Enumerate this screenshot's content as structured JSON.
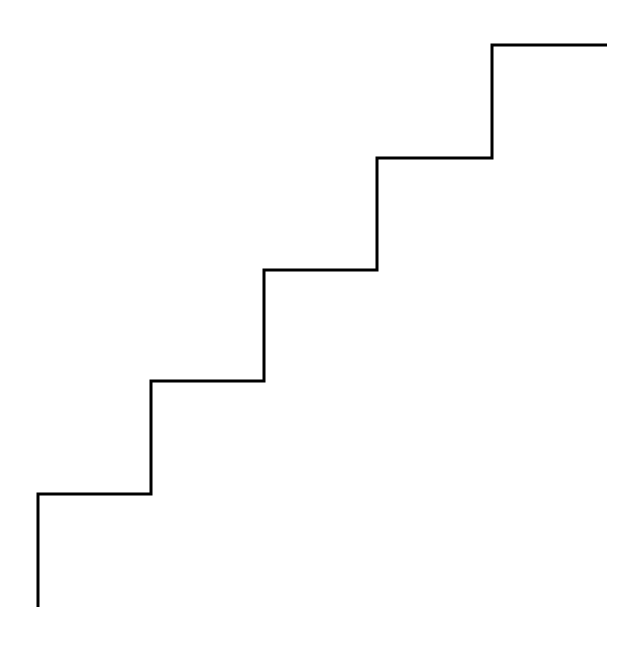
{
  "diagram": {
    "type": "staircase-line",
    "steps": 5,
    "stroke_color": "#000000",
    "background_color": "#ffffff",
    "direction": "ascending-left-to-right"
  }
}
